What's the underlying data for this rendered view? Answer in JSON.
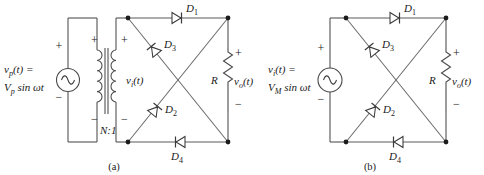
{
  "figure": {
    "panels": [
      {
        "caption": "(a)",
        "source": {
          "line1": "v",
          "line1_sub": "p",
          "line1_rest": "(t) =",
          "line2": "V",
          "line2_sub": "p",
          "line2_rest": " sin ωt",
          "plus": "+",
          "minus": "−",
          "icon": "ac-source-icon"
        },
        "transformer": {
          "ratio": "N:1",
          "primary_plus": "+",
          "primary_minus": "−",
          "secondary_plus": "+",
          "secondary_minus": "−",
          "secondary_label": "v",
          "secondary_label_sub": "i",
          "secondary_label_rest": "(t)"
        },
        "diodes": [
          {
            "name": "D",
            "sub": "1",
            "position": "top",
            "direction": "right"
          },
          {
            "name": "D",
            "sub": "3",
            "position": "diagonal-upper",
            "direction": "up-left"
          },
          {
            "name": "D",
            "sub": "2",
            "position": "diagonal-lower",
            "direction": "up-left"
          },
          {
            "name": "D",
            "sub": "4",
            "position": "bottom",
            "direction": "left"
          }
        ],
        "load": {
          "resistor": "R",
          "output_label": "v",
          "output_sub": "o",
          "output_rest": "(t)",
          "plus": "+",
          "minus": "−"
        }
      },
      {
        "caption": "(b)",
        "source": {
          "line1": "v",
          "line1_sub": "i",
          "line1_rest": "(t) =",
          "line2": "V",
          "line2_sub": "M",
          "line2_rest": " sin ωt",
          "plus": "+",
          "minus": "−",
          "icon": "ac-source-icon"
        },
        "diodes": [
          {
            "name": "D",
            "sub": "1",
            "position": "top",
            "direction": "right"
          },
          {
            "name": "D",
            "sub": "3",
            "position": "diagonal-upper",
            "direction": "up-left"
          },
          {
            "name": "D",
            "sub": "2",
            "position": "diagonal-lower",
            "direction": "up-left"
          },
          {
            "name": "D",
            "sub": "4",
            "position": "bottom",
            "direction": "left"
          }
        ],
        "load": {
          "resistor": "R",
          "output_label": "v",
          "output_sub": "o",
          "output_rest": "(t)",
          "plus": "+",
          "minus": "−"
        }
      }
    ]
  },
  "colors": {
    "wire": "#5a5a5a",
    "node": "#1c1c1c",
    "text": "#1a1a1a",
    "background": "#ffffff"
  }
}
